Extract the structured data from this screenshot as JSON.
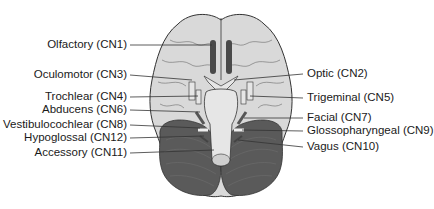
{
  "figure": {
    "colors": {
      "cerebrum_fill": "#d9d9d9",
      "cerebrum_stroke": "#333333",
      "cerebellum_fill": "#5a5a5a",
      "olfactory_tract": "#4a4a4a",
      "brainstem_fill": "#e6e6e6",
      "leader_line": "#333333"
    }
  },
  "labels_left": [
    {
      "text": "Olfactory (CN1)",
      "y": 44
    },
    {
      "text": "Oculomotor (CN3)",
      "y": 74
    },
    {
      "text": "Trochlear (CN4)",
      "y": 96
    },
    {
      "text": "Abducens (CN6)",
      "y": 109
    },
    {
      "text": "Vestibulocochlear (CN8)",
      "y": 124
    },
    {
      "text": "Hypoglossal (CN12)",
      "y": 137
    },
    {
      "text": "Accessory (CN11)",
      "y": 152
    }
  ],
  "labels_right": [
    {
      "text": "Optic (CN2)",
      "y": 73
    },
    {
      "text": "Trigeminal (CN5)",
      "y": 97
    },
    {
      "text": "Facial (CN7)",
      "y": 117
    },
    {
      "text": "Glossopharyngeal (CN9)",
      "y": 130
    },
    {
      "text": "Vagus (CN10)",
      "y": 146
    }
  ]
}
